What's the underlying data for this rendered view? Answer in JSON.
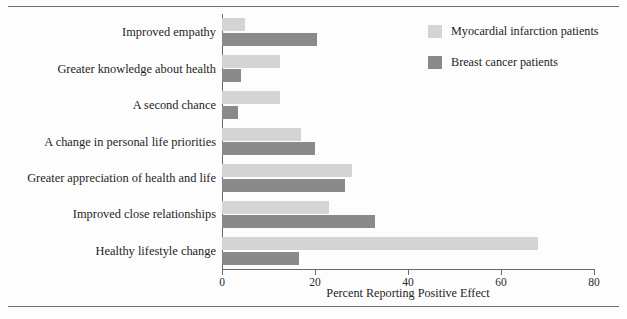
{
  "chart_data": {
    "type": "bar",
    "orientation": "horizontal",
    "title": "",
    "xlabel": "Percent Reporting Positive Effect",
    "ylabel": "",
    "xlim": [
      0,
      80
    ],
    "xticks": [
      0,
      20,
      40,
      60,
      80
    ],
    "xtick_labels": [
      "0",
      "20",
      "40",
      "60",
      "80"
    ],
    "grid": false,
    "legend_position": "top-right",
    "categories": [
      "Improved empathy",
      "Greater knowledge about health",
      "A second chance",
      "A change in personal life priorities",
      "Greater appreciation of health and life",
      "Improved close relationships",
      "Healthy lifestyle change"
    ],
    "series": [
      {
        "name": "Myocardial infarction patients",
        "color": "#d4d4d4",
        "values": [
          5,
          12.5,
          12.5,
          17,
          28,
          23,
          68
        ]
      },
      {
        "name": "Breast cancer patients",
        "color": "#8a8a8a",
        "values": [
          20.5,
          4,
          3.5,
          20,
          26.5,
          33,
          16.5
        ]
      }
    ]
  },
  "legend": {
    "items": [
      {
        "label": "Myocardial infarction patients",
        "swatch": "light"
      },
      {
        "label": "Breast cancer patients",
        "swatch": "dark"
      }
    ]
  },
  "axis": {
    "x_title": "Percent Reporting Positive Effect"
  }
}
